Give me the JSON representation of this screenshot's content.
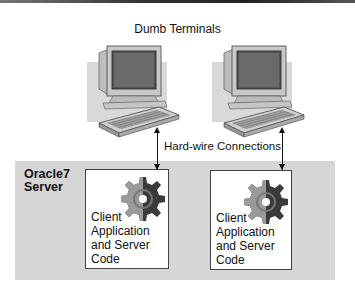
{
  "diagram": {
    "title": "Dumb Terminals",
    "connection_label": "Hard-wire Connections",
    "server": {
      "label_line1": "Oracle7",
      "label_line2": "Server"
    },
    "boxes": [
      {
        "line1": "Client",
        "line2": "Application",
        "line3": "and Server",
        "line4": "Code",
        "icon": "gear-icon"
      },
      {
        "line1": "Client",
        "line2": "Application",
        "line3": "and Server",
        "line4": "Code",
        "icon": "gear-icon"
      }
    ],
    "terminals": [
      {
        "icon": "computer-terminal-icon"
      },
      {
        "icon": "computer-terminal-icon"
      }
    ],
    "colors": {
      "server_bg": "#d6d6d6",
      "box_bg": "#ffffff",
      "gear_light": "#9a9a9a",
      "gear_dark": "#333333"
    }
  }
}
